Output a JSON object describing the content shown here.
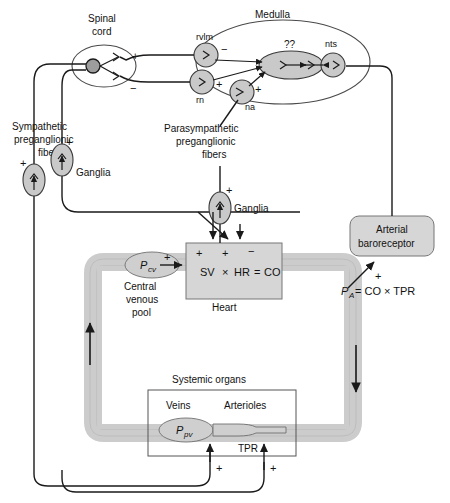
{
  "figure": {
    "caption": ""
  },
  "regions": {
    "spinal_cord": "Spinal\ncord",
    "spinal_cord_line1": "Spinal",
    "spinal_cord_line2": "cord",
    "medulla": "Medulla",
    "systemic_organs": "Systemic organs",
    "heart": "Heart"
  },
  "medulla_nuclei": [
    {
      "id": "rvlm",
      "label": "rvlm"
    },
    {
      "id": "rn",
      "label": "rn"
    },
    {
      "id": "na",
      "label": "na"
    },
    {
      "id": "nts",
      "label": "nts"
    },
    {
      "id": "unknown",
      "label": "??"
    }
  ],
  "nerve_labels": {
    "sympathetic": {
      "line1": "Sympathetic",
      "line2": "preganglionic",
      "line3": "fibers"
    },
    "parasympathetic": {
      "line1": "Parasympathetic",
      "line2": "preganglionic",
      "line3": "fibers"
    },
    "ganglia_left": "Ganglia",
    "ganglia_heart": "Ganglia"
  },
  "boxes": {
    "baroreceptor_line1": "Arterial",
    "baroreceptor_line2": "baroreceptor",
    "heart_equation": {
      "sv": "SV",
      "times": "×",
      "hr": "HR",
      "equals": "=",
      "co": "CO"
    },
    "pressure_equation": {
      "pa_symbol": "P",
      "pa_sub": "A",
      "rest": "= CO × TPR"
    }
  },
  "vessel_labels": {
    "central_venous_pool_line1": "Central",
    "central_venous_pool_line2": "venous",
    "central_venous_pool_line3": "pool",
    "pcv_symbol": "P",
    "pcv_sub": "cv",
    "veins": "Veins",
    "arterioles": "Arterioles",
    "ppv_symbol": "P",
    "ppv_sub": "pv",
    "tpr": "TPR"
  },
  "signs": {
    "plus": "+",
    "minus": "−"
  },
  "sign_markers": [
    {
      "name": "spinal-cord-plus",
      "symbol": "+"
    },
    {
      "name": "spinal-cord-minus",
      "symbol": "−"
    },
    {
      "name": "rvlm-minus",
      "symbol": "−"
    },
    {
      "name": "rn-plus",
      "symbol": "+"
    },
    {
      "name": "na-plus",
      "symbol": "+"
    },
    {
      "name": "ganglia-left-outer-plus",
      "symbol": "+"
    },
    {
      "name": "ganglia-left-inner-plus",
      "symbol": "+"
    },
    {
      "name": "ganglia-heart-plus",
      "symbol": "+"
    },
    {
      "name": "heart-sv-plus",
      "symbol": "+"
    },
    {
      "name": "heart-hr-plus",
      "symbol": "+"
    },
    {
      "name": "heart-hr-minus",
      "symbol": "−"
    },
    {
      "name": "pcv-plus",
      "symbol": "+"
    },
    {
      "name": "baroreceptor-plus",
      "symbol": "+"
    },
    {
      "name": "veins-plus",
      "symbol": "+"
    },
    {
      "name": "tpr-plus",
      "symbol": "+"
    }
  ],
  "colors": {
    "vessel_fill": "#cccccc",
    "nucleus_fill": "#c9c9c9",
    "box_fill": "#d6d6d6",
    "organ_fill": "#cfcfcf",
    "stroke": "#1a1a1a",
    "background": "#ffffff"
  }
}
